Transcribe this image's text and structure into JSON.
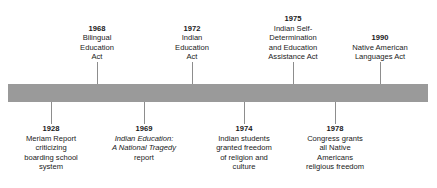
{
  "figure": {
    "type": "horizontal-timeline",
    "bar_color": "#9a9a9a",
    "background_color": "#ffffff",
    "tick_color": "#8d8d8d",
    "text_color": "#1a1a1a"
  },
  "events_above": [
    {
      "year": "1968",
      "lines": [
        "Bilingual",
        "Education",
        "Act"
      ],
      "x": 97
    },
    {
      "year": "1972",
      "lines": [
        "Indian",
        "Education",
        "Act"
      ],
      "x": 192
    },
    {
      "year": "1975",
      "lines": [
        "Indian Self-",
        "Determination",
        "and Education",
        "Assistance Act"
      ],
      "x": 293
    },
    {
      "year": "1990",
      "lines": [
        "Native American",
        "Languages Act"
      ],
      "x": 380
    }
  ],
  "events_below": [
    {
      "year": "1928",
      "lines": [
        "Meriam Report",
        "criticizing",
        "boarding school",
        "system"
      ],
      "x": 51
    },
    {
      "year": "1969",
      "lines": [
        "Indian Education:",
        "A National Tragedy",
        "report"
      ],
      "italic_lines": [
        0,
        1
      ],
      "x": 144
    },
    {
      "year": "1974",
      "lines": [
        "Indian students",
        "granted freedom",
        "of religion and",
        "culture"
      ],
      "x": 244
    },
    {
      "year": "1978",
      "lines": [
        "Congress grants",
        "all Native",
        "Americans",
        "religious freedom"
      ],
      "x": 335
    }
  ]
}
